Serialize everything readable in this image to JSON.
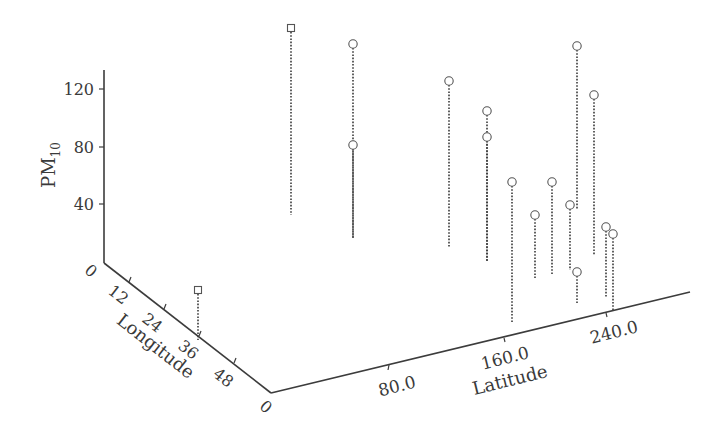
{
  "chart_data": {
    "type": "scatter",
    "subtype": "3d-stem-scatter",
    "title": "",
    "axes": {
      "z": {
        "label": "PM",
        "label_subscript": "10",
        "ticks": [
          "0",
          "40",
          "80",
          "120"
        ],
        "range": [
          0,
          140
        ]
      },
      "x": {
        "label": "Longitude",
        "ticks": [
          "0",
          "12",
          "24",
          "36",
          "48",
          "0"
        ],
        "range": [
          0,
          60
        ]
      },
      "y": {
        "label": "Latitude",
        "ticks": [
          "0",
          "80.0",
          "160.0",
          "240.0"
        ],
        "range": [
          0,
          320
        ]
      }
    },
    "grid": false,
    "legend": null,
    "markers": {
      "square": "square marker series",
      "circle": "circle marker series"
    },
    "series": [
      {
        "name": "squares",
        "marker": "square",
        "points": [
          {
            "px": 291,
            "py": 28,
            "base_y": 215,
            "pm10_est": 140
          },
          {
            "px": 198,
            "py": 290,
            "base_y": 340,
            "pm10_est": 35
          }
        ]
      },
      {
        "name": "circles",
        "marker": "circle",
        "points": [
          {
            "px": 353,
            "py": 44,
            "base_y": 238,
            "pm10_est": 140
          },
          {
            "px": 353,
            "py": 145,
            "base_y": 238,
            "pm10_est": 80
          },
          {
            "px": 449,
            "py": 81,
            "base_y": 248,
            "pm10_est": 125
          },
          {
            "px": 487,
            "py": 111,
            "base_y": 262,
            "pm10_est": 105
          },
          {
            "px": 487,
            "py": 137,
            "base_y": 262,
            "pm10_est": 87
          },
          {
            "px": 512,
            "py": 182,
            "base_y": 323,
            "pm10_est": 57
          },
          {
            "px": 535,
            "py": 215,
            "base_y": 278,
            "pm10_est": 32
          },
          {
            "px": 552,
            "py": 182,
            "base_y": 275,
            "pm10_est": 57
          },
          {
            "px": 577,
            "py": 46,
            "base_y": 210,
            "pm10_est": 148
          },
          {
            "px": 594,
            "py": 95,
            "base_y": 255,
            "pm10_est": 115
          },
          {
            "px": 570,
            "py": 205,
            "base_y": 270,
            "pm10_est": 40
          },
          {
            "px": 577,
            "py": 272,
            "base_y": 303,
            "pm10_est": 8
          },
          {
            "px": 606,
            "py": 227,
            "base_y": 298,
            "pm10_est": 25
          },
          {
            "px": 613,
            "py": 234,
            "base_y": 310,
            "pm10_est": 22
          }
        ]
      }
    ]
  }
}
